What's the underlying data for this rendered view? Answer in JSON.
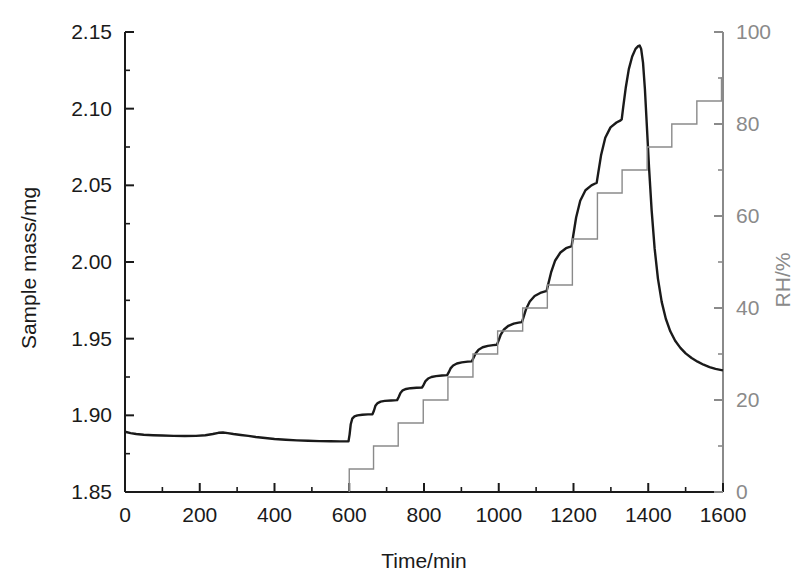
{
  "chart_data": {
    "type": "line",
    "title": "",
    "xlabel": "Time/min",
    "ylabel": "Sample mass/mg",
    "y2label": "RH/%",
    "xlim": [
      0,
      1600
    ],
    "ylim": [
      1.85,
      2.15
    ],
    "y2lim": [
      0,
      100
    ],
    "grid": false,
    "legend": "none",
    "xticks": [
      0,
      200,
      400,
      600,
      800,
      1000,
      1200,
      1400,
      1600
    ],
    "xtick_labels": [
      "0",
      "200",
      "400",
      "600",
      "800",
      "1000",
      "1200",
      "1400",
      "1600"
    ],
    "xminor_step": 100,
    "yticks": [
      1.85,
      1.9,
      1.95,
      2.0,
      2.05,
      2.1,
      2.15
    ],
    "ytick_labels": [
      "1.85",
      "1.90",
      "1.95",
      "2.00",
      "2.05",
      "2.10",
      "2.15"
    ],
    "yminor_step": 0.025,
    "y2ticks": [
      0,
      20,
      40,
      60,
      80,
      100
    ],
    "y2tick_labels": [
      "0",
      "20",
      "40",
      "60",
      "80",
      "100"
    ],
    "y2minor_step": 10,
    "series": [
      {
        "name": "Sample mass",
        "axis": "left",
        "color": "#1a1a1a",
        "width": 2.4,
        "points": [
          [
            0,
            1.8893
          ],
          [
            15,
            1.8884
          ],
          [
            30,
            1.8878
          ],
          [
            50,
            1.8873
          ],
          [
            75,
            1.887
          ],
          [
            100,
            1.8868
          ],
          [
            130,
            1.8866
          ],
          [
            160,
            1.8865
          ],
          [
            190,
            1.8866
          ],
          [
            215,
            1.887
          ],
          [
            235,
            1.8878
          ],
          [
            250,
            1.8886
          ],
          [
            262,
            1.8888
          ],
          [
            275,
            1.8884
          ],
          [
            290,
            1.8878
          ],
          [
            310,
            1.8872
          ],
          [
            330,
            1.8866
          ],
          [
            350,
            1.8859
          ],
          [
            375,
            1.8852
          ],
          [
            400,
            1.8846
          ],
          [
            430,
            1.8841
          ],
          [
            460,
            1.8837
          ],
          [
            490,
            1.8834
          ],
          [
            520,
            1.8832
          ],
          [
            550,
            1.8831
          ],
          [
            575,
            1.883
          ],
          [
            598,
            1.883
          ],
          [
            601,
            1.8876
          ],
          [
            604,
            1.8942
          ],
          [
            608,
            1.8978
          ],
          [
            614,
            1.8993
          ],
          [
            622,
            1.9
          ],
          [
            635,
            1.9004
          ],
          [
            650,
            1.9006
          ],
          [
            662,
            1.9007
          ],
          [
            666,
            1.903
          ],
          [
            670,
            1.9062
          ],
          [
            676,
            1.908
          ],
          [
            684,
            1.9089
          ],
          [
            695,
            1.9094
          ],
          [
            712,
            1.9097
          ],
          [
            728,
            1.9099
          ],
          [
            732,
            1.9118
          ],
          [
            737,
            1.9146
          ],
          [
            743,
            1.9163
          ],
          [
            752,
            1.9172
          ],
          [
            764,
            1.9177
          ],
          [
            780,
            1.918
          ],
          [
            795,
            1.9182
          ],
          [
            799,
            1.9199
          ],
          [
            804,
            1.9223
          ],
          [
            811,
            1.924
          ],
          [
            820,
            1.925
          ],
          [
            832,
            1.9256
          ],
          [
            848,
            1.926
          ],
          [
            862,
            1.9262
          ],
          [
            866,
            1.928
          ],
          [
            871,
            1.9306
          ],
          [
            878,
            1.9325
          ],
          [
            888,
            1.9338
          ],
          [
            901,
            1.9345
          ],
          [
            917,
            1.935
          ],
          [
            928,
            1.9352
          ],
          [
            932,
            1.9372
          ],
          [
            938,
            1.9403
          ],
          [
            946,
            1.9428
          ],
          [
            957,
            1.9444
          ],
          [
            971,
            1.9453
          ],
          [
            985,
            1.9458
          ],
          [
            995,
            1.946
          ],
          [
            999,
            1.9484
          ],
          [
            1005,
            1.9524
          ],
          [
            1014,
            1.956
          ],
          [
            1026,
            1.9584
          ],
          [
            1040,
            1.9598
          ],
          [
            1053,
            1.9605
          ],
          [
            1062,
            1.9608
          ],
          [
            1066,
            1.9638
          ],
          [
            1073,
            1.9692
          ],
          [
            1083,
            1.9742
          ],
          [
            1096,
            1.9778
          ],
          [
            1111,
            1.9798
          ],
          [
            1124,
            1.9808
          ],
          [
            1128,
            1.981
          ],
          [
            1132,
            1.9852
          ],
          [
            1140,
            1.9932
          ],
          [
            1151,
            2.001
          ],
          [
            1165,
            2.0062
          ],
          [
            1180,
            2.009
          ],
          [
            1192,
            2.01
          ],
          [
            1195,
            2.0103
          ],
          [
            1199,
            2.0168
          ],
          [
            1207,
            2.029
          ],
          [
            1218,
            2.04
          ],
          [
            1232,
            2.0468
          ],
          [
            1248,
            2.05
          ],
          [
            1258,
            2.0512
          ],
          [
            1262,
            2.0516
          ],
          [
            1266,
            2.0578
          ],
          [
            1274,
            2.07
          ],
          [
            1285,
            2.081
          ],
          [
            1299,
            2.0878
          ],
          [
            1315,
            2.091
          ],
          [
            1326,
            2.0924
          ],
          [
            1329,
            2.093
          ],
          [
            1333,
            2.101
          ],
          [
            1340,
            2.114
          ],
          [
            1348,
            2.1258
          ],
          [
            1357,
            2.134
          ],
          [
            1366,
            2.139
          ],
          [
            1373,
            2.1408
          ],
          [
            1377,
            2.1412
          ],
          [
            1381,
            2.139
          ],
          [
            1386,
            2.13
          ],
          [
            1391,
            2.113
          ],
          [
            1396,
            2.09
          ],
          [
            1402,
            2.062
          ],
          [
            1409,
            2.034
          ],
          [
            1417,
            2.009
          ],
          [
            1426,
            1.989
          ],
          [
            1436,
            1.974
          ],
          [
            1447,
            1.963
          ],
          [
            1459,
            1.9548
          ],
          [
            1472,
            1.9486
          ],
          [
            1486,
            1.944
          ],
          [
            1500,
            1.9404
          ],
          [
            1516,
            1.9374
          ],
          [
            1532,
            1.935
          ],
          [
            1548,
            1.933
          ],
          [
            1564,
            1.9315
          ],
          [
            1580,
            1.9303
          ],
          [
            1596,
            1.9295
          ],
          [
            1600,
            1.9293
          ]
        ]
      },
      {
        "name": "RH",
        "axis": "right",
        "color": "#8a8a8a",
        "width": 1.4,
        "step": true,
        "points": [
          [
            600,
            0
          ],
          [
            600,
            5
          ],
          [
            665,
            5
          ],
          [
            665,
            10
          ],
          [
            731,
            10
          ],
          [
            731,
            15
          ],
          [
            798,
            15
          ],
          [
            798,
            20
          ],
          [
            864,
            20
          ],
          [
            864,
            25
          ],
          [
            931,
            25
          ],
          [
            931,
            30
          ],
          [
            997,
            30
          ],
          [
            997,
            35
          ],
          [
            1064,
            35
          ],
          [
            1064,
            40
          ],
          [
            1130,
            40
          ],
          [
            1130,
            45
          ],
          [
            1197,
            45
          ],
          [
            1197,
            55
          ],
          [
            1264,
            55
          ],
          [
            1264,
            65
          ],
          [
            1330,
            65
          ],
          [
            1330,
            70
          ],
          [
            1397,
            70
          ],
          [
            1397,
            75
          ],
          [
            1463,
            75
          ],
          [
            1463,
            80
          ],
          [
            1530,
            80
          ],
          [
            1530,
            85
          ],
          [
            1596,
            85
          ],
          [
            1596,
            90
          ],
          [
            1600,
            90
          ]
        ]
      }
    ],
    "rh_program_percent": [
      5,
      10,
      15,
      20,
      25,
      30,
      35,
      40,
      45,
      55,
      65,
      70,
      75,
      80,
      85,
      90
    ],
    "rh_step_start_min": 600,
    "rh_step_width_min": 66,
    "mass_initial_mg": 1.889,
    "mass_min_mg": 1.883,
    "mass_peak_mg": 2.141,
    "mass_peak_time_min": 1377,
    "mass_final_mg": 1.929
  }
}
